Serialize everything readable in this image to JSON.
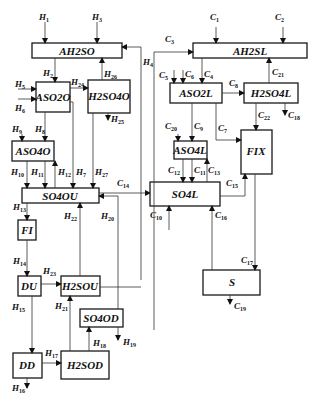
{
  "diagram": {
    "type": "process-flow",
    "boxes": {
      "AH2SO": "AH2SO",
      "ASO2O": "ASO2O",
      "H2SO4O": "H2SO4O",
      "ASO4O": "ASO4O",
      "SO4OU": "SO4OU",
      "FI": "FI",
      "DU": "DU",
      "H2SOU": "H2SOU",
      "SO4OD": "SO4OD",
      "DD": "DD",
      "H2SOD": "H2SOD",
      "AH2SL": "AH2SL",
      "ASO2L": "ASO2L",
      "H2SO4L": "H2SO4L",
      "ASO4L": "ASO4L",
      "FIX": "FIX",
      "SO4L": "SO4L",
      "S": "S"
    },
    "flows": {
      "H1": {
        "base": "H",
        "sub": "1"
      },
      "H2": {
        "base": "H",
        "sub": "2"
      },
      "H3": {
        "base": "H",
        "sub": "3"
      },
      "H4": {
        "base": "H",
        "sub": "4"
      },
      "H5": {
        "base": "H",
        "sub": "5"
      },
      "H6": {
        "base": "H",
        "sub": "6"
      },
      "H7": {
        "base": "H",
        "sub": "7"
      },
      "H8": {
        "base": "H",
        "sub": "8"
      },
      "H9": {
        "base": "H",
        "sub": "9"
      },
      "H10": {
        "base": "H",
        "sub": "10"
      },
      "H11": {
        "base": "H",
        "sub": "11"
      },
      "H12": {
        "base": "H",
        "sub": "12"
      },
      "H13": {
        "base": "H",
        "sub": "13"
      },
      "H14": {
        "base": "H",
        "sub": "14"
      },
      "H15": {
        "base": "H",
        "sub": "15"
      },
      "H16": {
        "base": "H",
        "sub": "16"
      },
      "H17": {
        "base": "H",
        "sub": "17"
      },
      "H18": {
        "base": "H",
        "sub": "18"
      },
      "H19": {
        "base": "H",
        "sub": "19"
      },
      "H20": {
        "base": "H",
        "sub": "20"
      },
      "H21": {
        "base": "H",
        "sub": "21"
      },
      "H22": {
        "base": "H",
        "sub": "22"
      },
      "H23": {
        "base": "H",
        "sub": "23"
      },
      "H24": {
        "base": "H",
        "sub": "24"
      },
      "H25": {
        "base": "H",
        "sub": "25"
      },
      "H26": {
        "base": "H",
        "sub": "26"
      },
      "H27": {
        "base": "H",
        "sub": "27"
      },
      "C1": {
        "base": "C",
        "sub": "1"
      },
      "C2": {
        "base": "C",
        "sub": "2"
      },
      "C3": {
        "base": "C",
        "sub": "3"
      },
      "C4": {
        "base": "C",
        "sub": "4"
      },
      "C5": {
        "base": "C",
        "sub": "5"
      },
      "C6": {
        "base": "C",
        "sub": "6"
      },
      "C7": {
        "base": "C",
        "sub": "7"
      },
      "C8": {
        "base": "C",
        "sub": "8"
      },
      "C9": {
        "base": "C",
        "sub": "9"
      },
      "C10": {
        "base": "C",
        "sub": "10"
      },
      "C11": {
        "base": "C",
        "sub": "11"
      },
      "C12": {
        "base": "C",
        "sub": "12"
      },
      "C13": {
        "base": "C",
        "sub": "13"
      },
      "C14": {
        "base": "C",
        "sub": "14"
      },
      "C15": {
        "base": "C",
        "sub": "15"
      },
      "C16": {
        "base": "C",
        "sub": "16"
      },
      "C17": {
        "base": "C",
        "sub": "17"
      },
      "C18": {
        "base": "C",
        "sub": "18"
      },
      "C19": {
        "base": "C",
        "sub": "19"
      },
      "C20": {
        "base": "C",
        "sub": "20"
      },
      "C21": {
        "base": "C",
        "sub": "21"
      },
      "C22": {
        "base": "C",
        "sub": "22"
      }
    }
  }
}
